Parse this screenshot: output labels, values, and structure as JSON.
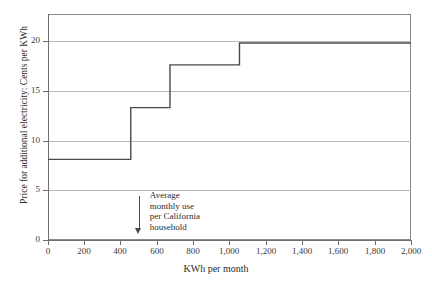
{
  "chart_data": {
    "type": "line",
    "subtype": "step-post",
    "title": "",
    "xlabel": "KWh per month",
    "ylabel": "Price for additional electricity: Cents per KWh",
    "xlim": [
      0,
      2000
    ],
    "ylim": [
      0,
      22.7
    ],
    "grid": true,
    "grid_axis": "y",
    "legend": "none",
    "xticks": [
      0,
      200,
      400,
      600,
      800,
      1000,
      1200,
      1400,
      1600,
      1800,
      2000
    ],
    "xticklabels": [
      "0",
      "200",
      "400",
      "600",
      "800",
      "1,000",
      "1,200",
      "1,400",
      "1,600",
      "1,800",
      "2,000"
    ],
    "yticks": [
      0,
      5,
      10,
      15,
      20
    ],
    "yticklabels": [
      "0",
      "5",
      "10",
      "15",
      "20"
    ],
    "series": [
      {
        "name": "Tiered marginal price of electricity",
        "color": "#4a4a4a",
        "steps": [
          {
            "x_start": 0,
            "x_end": 456,
            "y": 8.1
          },
          {
            "x_start": 456,
            "x_end": 672,
            "y": 13.3
          },
          {
            "x_start": 672,
            "x_end": 1055,
            "y": 17.6
          },
          {
            "x_start": 1055,
            "x_end": 2000,
            "y": 19.8
          }
        ]
      }
    ],
    "annotations": [
      {
        "name": "average-use-marker",
        "x": 550,
        "lines": [
          "Average",
          "monthly use",
          "per California",
          "household"
        ],
        "arrow": "down"
      }
    ]
  },
  "axis": {
    "y_title": "Price for additional electricity: Cents per KWh",
    "x_title": "KWh per month",
    "y_tick_0": "0",
    "y_tick_5": "5",
    "y_tick_10": "10",
    "y_tick_15": "15",
    "y_tick_20": "20",
    "x_tick_0": "0",
    "x_tick_200": "200",
    "x_tick_400": "400",
    "x_tick_600": "600",
    "x_tick_800": "800",
    "x_tick_1000": "1,000",
    "x_tick_1200": "1,200",
    "x_tick_1400": "1,400",
    "x_tick_1600": "1,600",
    "x_tick_1800": "1,800",
    "x_tick_2000": "2,000"
  },
  "annotation": {
    "line1": "Average",
    "line2": "monthly use",
    "line3": "per California",
    "line4": "household"
  },
  "colors": {
    "step_line": "#4a4a4a",
    "gridline": "#b9b9b9",
    "frame": "#8a8a8a",
    "text": "#2b2b2b",
    "background": "#ffffff"
  }
}
